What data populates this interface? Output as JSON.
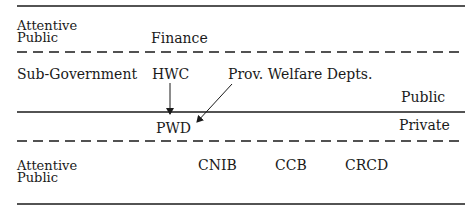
{
  "diagram": {
    "bands": {
      "top_attentive_public": "Attentive Public",
      "sub_government": "Sub-Government",
      "bottom_attentive_public": "Attentive Public"
    },
    "sector_labels": {
      "public": "Public",
      "private": "Private"
    },
    "nodes": {
      "finance": "Finance",
      "hwc": "HWC",
      "prov_welfare": "Prov. Welfare Depts.",
      "pwd": "PWD",
      "cnib": "CNIB",
      "ccb": "CCB",
      "crcd": "CRCD"
    },
    "edges": [
      {
        "from": "HWC",
        "to": "PWD"
      },
      {
        "from": "Prov. Welfare Depts.",
        "to": "PWD"
      }
    ],
    "colors": {
      "ink": "#1a1a1a",
      "background": "#ffffff"
    }
  }
}
